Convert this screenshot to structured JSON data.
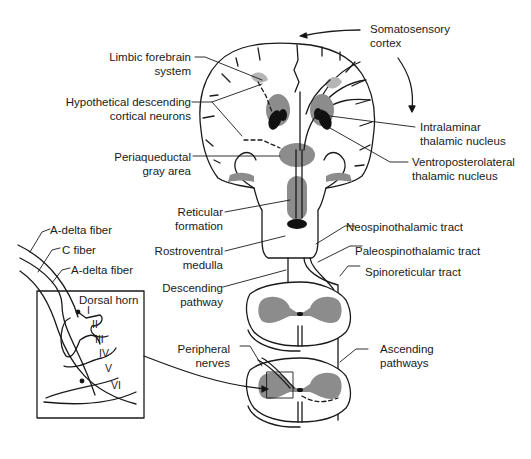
{
  "diagram": {
    "type": "anatomical pain pathway diagram",
    "colors": {
      "line": "#1a1a1a",
      "shade": "#8c8c8c",
      "light_shade": "#b5b5b5",
      "background": "#ffffff"
    },
    "labels": {
      "somatosensory_cortex": [
        "Somatosensory",
        "cortex"
      ],
      "limbic_forebrain": [
        "Limbic forebrain",
        "system"
      ],
      "hypothetical_descending": [
        "Hypothetical descending",
        "cortical neurons"
      ],
      "intralaminar": [
        "Intralaminar",
        "thalamic nucleus"
      ],
      "ventroposterolateral": [
        "Ventroposterolateral",
        "thalamic nucleus"
      ],
      "periaqueductal": [
        "Periaqueductal",
        "gray area"
      ],
      "reticular_formation": [
        "Reticular",
        "formation"
      ],
      "rostroventral_medulla": [
        "Rostroventral",
        "medulla"
      ],
      "descending_pathway": [
        "Descending",
        "pathway"
      ],
      "neospinothalamic": "Neospinothalamic tract",
      "paleospinothalamic": "Paleospinothalamic tract",
      "spinoreticular": "Spinoreticular tract",
      "peripheral_nerves": [
        "Peripheral",
        "nerves"
      ],
      "ascending_pathways": [
        "Ascending",
        "pathways"
      ],
      "a_delta_fiber_1": "A-delta fiber",
      "c_fiber": "C fiber",
      "a_delta_fiber_2": "A-delta fiber",
      "dorsal_horn": "Dorsal horn",
      "laminae": [
        "I",
        "II",
        "III",
        "IV",
        "V",
        "VI"
      ]
    }
  }
}
